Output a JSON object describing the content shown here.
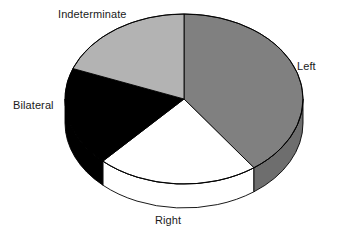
{
  "chart_data": {
    "type": "pie",
    "title": "",
    "subtitle": "",
    "xlabel": "",
    "ylabel": "",
    "legend_position": "none",
    "grid": false,
    "three_d": true,
    "start_angle_deg": 0,
    "direction": "clockwise",
    "categories": [
      "Left",
      "Right",
      "Bilateral",
      "Indeterminate"
    ],
    "values": [
      40,
      22,
      19,
      19
    ],
    "units": "percent",
    "slices": [
      {
        "label": "Left",
        "value": 40,
        "percent": 40,
        "color": "#808080",
        "side_color": "#6e6e6e",
        "start_angle_deg": 0,
        "end_angle_deg": 144,
        "label_position": "right",
        "exploded": false
      },
      {
        "label": "Right",
        "value": 22,
        "percent": 22,
        "color": "#ffffff",
        "side_color": "#ffffff",
        "start_angle_deg": 144,
        "end_angle_deg": 223,
        "label_position": "bottom",
        "exploded": false
      },
      {
        "label": "Bilateral",
        "value": 19,
        "percent": 19,
        "color": "#000000",
        "side_color": "#000000",
        "start_angle_deg": 223,
        "end_angle_deg": 291,
        "label_position": "left",
        "exploded": false
      },
      {
        "label": "Indeterminate",
        "value": 19,
        "percent": 19,
        "color": "#b3b3b3",
        "side_color": "#9e9e9e",
        "start_angle_deg": 291,
        "end_angle_deg": 360,
        "label_position": "top-left",
        "exploded": false
      }
    ],
    "labels": {
      "indeterminate": "Indeterminate",
      "left": "Left",
      "bilateral": "Bilateral",
      "right": "Right"
    },
    "geometry": {
      "center_x": 184,
      "center_y": 99,
      "radius_x": 119,
      "radius_y": 85,
      "depth": 24
    },
    "colors": {
      "background": "#ffffff",
      "outline": "#000000",
      "text": "#1a1a1a"
    }
  }
}
